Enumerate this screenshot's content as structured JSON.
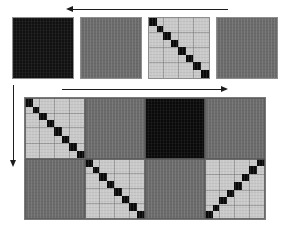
{
  "figure": {
    "name": "hierarchical-block-matrix-figure",
    "background": "#ffffff",
    "width": 287,
    "height": 238
  },
  "palette": {
    "black": "#0a0a0a",
    "dark": "#151515",
    "mid_gray": "#6b6b6b",
    "light_gray": "#c9c9c9",
    "border": "#8e8e8e",
    "arrow": "#1c1c1c",
    "page": "#ffffff"
  },
  "arrows": [
    {
      "id": "top-arrow",
      "name": "top-horizontal-arrow",
      "direction": "left",
      "orientation": "horizontal",
      "x": 66,
      "y": 5,
      "length": 162,
      "thickness": 8
    },
    {
      "id": "left-arrow",
      "name": "left-vertical-arrow",
      "direction": "down",
      "orientation": "vertical",
      "x": 9,
      "y": 85,
      "length": 82,
      "thickness": 8
    },
    {
      "id": "middle-arrow",
      "name": "middle-horizontal-arrow",
      "direction": "right",
      "orientation": "horizontal",
      "x": 62,
      "y": 85,
      "length": 166,
      "thickness": 8
    }
  ],
  "top_row": {
    "name": "top-row-matrix-sequence",
    "count": 4,
    "y": 17,
    "size": 62,
    "tiles": [
      {
        "id": "top-tile-1",
        "name": "matrix-tile-solid-black",
        "index": 0,
        "x": 12,
        "pattern": "solid",
        "fill": "#111111",
        "label": "full dense block"
      },
      {
        "id": "top-tile-2",
        "name": "matrix-tile-solid-gray",
        "index": 1,
        "x": 80,
        "pattern": "solid",
        "fill": "#6b6b6b",
        "label": "medium density block"
      },
      {
        "id": "top-tile-3",
        "name": "matrix-tile-block-diagonal",
        "index": 2,
        "x": 148,
        "pattern": "diagonal",
        "fill": "#c9c9c9",
        "diagonal": "descending",
        "blocks": 8,
        "label": "block diagonal structure"
      },
      {
        "id": "top-tile-4",
        "name": "matrix-tile-solid-gray-2",
        "index": 3,
        "x": 216,
        "pattern": "solid",
        "fill": "#6b6b6b",
        "label": "medium density block"
      }
    ]
  },
  "bottom_matrix": {
    "name": "large-block-matrix",
    "x": 24,
    "y": 97,
    "width": 242,
    "height": 123,
    "rows": 2,
    "cols": 4,
    "cells": [
      {
        "id": "cell-r0c0",
        "name": "block-cell-diagonal",
        "row": 0,
        "col": 0,
        "pattern": "diagonal",
        "diagonal": "descending",
        "blocks": 8,
        "fill": "#c9c9c9"
      },
      {
        "id": "cell-r0c1",
        "name": "block-cell-gray",
        "row": 0,
        "col": 1,
        "pattern": "solid",
        "fill": "#6b6b6b"
      },
      {
        "id": "cell-r0c2",
        "name": "block-cell-black",
        "row": 0,
        "col": 2,
        "pattern": "solid",
        "fill": "#0a0a0a"
      },
      {
        "id": "cell-r0c3",
        "name": "block-cell-gray",
        "row": 0,
        "col": 3,
        "pattern": "solid",
        "fill": "#6b6b6b"
      },
      {
        "id": "cell-r1c0",
        "name": "block-cell-gray",
        "row": 1,
        "col": 0,
        "pattern": "solid",
        "fill": "#6b6b6b"
      },
      {
        "id": "cell-r1c1",
        "name": "block-cell-diagonal",
        "row": 1,
        "col": 1,
        "pattern": "diagonal",
        "diagonal": "descending",
        "blocks": 8,
        "fill": "#c9c9c9"
      },
      {
        "id": "cell-r1c2",
        "name": "block-cell-gray",
        "row": 1,
        "col": 2,
        "pattern": "solid",
        "fill": "#6b6b6b"
      },
      {
        "id": "cell-r1c3",
        "name": "block-cell-antidiagonal",
        "row": 1,
        "col": 3,
        "pattern": "diagonal",
        "diagonal": "ascending",
        "blocks": 8,
        "fill": "#c9c9c9"
      }
    ]
  }
}
